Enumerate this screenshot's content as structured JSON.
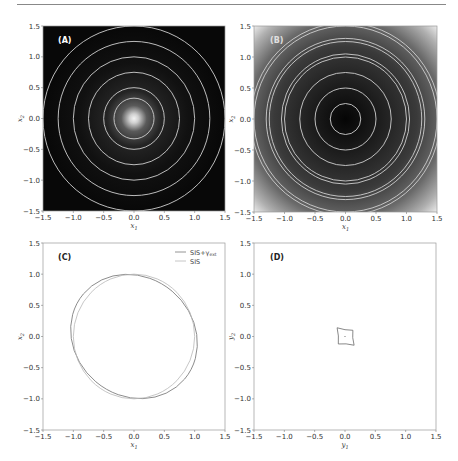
{
  "figure": {
    "panels": [
      "(A)",
      "(B)",
      "(C)",
      "(D)"
    ]
  },
  "chart_data": [
    {
      "type": "heatmap",
      "panel": "(A)",
      "title": "(A)",
      "xlabel": "x1",
      "ylabel": "x2",
      "xlim": [
        -1.5,
        1.5
      ],
      "ylim": [
        -1.5,
        1.5
      ],
      "xticks": [
        "-1.5",
        "-1.0",
        "-0.5",
        "0.0",
        "0.5",
        "1.0",
        "1.5"
      ],
      "yticks": [
        "-1.5",
        "-1.0",
        "-0.5",
        "0.0",
        "0.5",
        "1.0",
        "1.5"
      ],
      "background": "dark, bright central peak at origin",
      "contour_radii": [
        0.33,
        0.5,
        0.75,
        1.0,
        1.25,
        1.5
      ],
      "contour_color": "#cfcfcf"
    },
    {
      "type": "heatmap",
      "panel": "(B)",
      "title": "(B)",
      "xlabel": "x1",
      "ylabel": "x2",
      "xlim": [
        -1.5,
        1.5
      ],
      "ylim": [
        -1.5,
        1.5
      ],
      "xticks": [
        "-1.5",
        "-1.0",
        "-0.5",
        "0.0",
        "0.5",
        "1.0",
        "1.5"
      ],
      "yticks": [
        "-1.5",
        "-1.0",
        "-0.5",
        "0.0",
        "0.5",
        "1.0",
        "1.5"
      ],
      "background": "dark center brightening toward corners",
      "contour_radii": [
        0.25,
        0.5,
        0.75,
        1.0,
        1.05,
        1.25,
        1.3,
        1.5,
        1.55
      ],
      "contour_color": "#cfcfcf"
    },
    {
      "type": "line",
      "panel": "(C)",
      "title": "(C)",
      "xlabel": "x1",
      "ylabel": "x2",
      "xlim": [
        -1.5,
        1.5
      ],
      "ylim": [
        -1.5,
        1.5
      ],
      "xticks": [
        "-1.5",
        "-1.0",
        "-0.5",
        "0.0",
        "0.5",
        "1.0",
        "1.5"
      ],
      "yticks": [
        "-1.5",
        "-1.0",
        "-0.5",
        "0.0",
        "0.5",
        "1.0",
        "1.5"
      ],
      "legend_position": "upper right",
      "series": [
        {
          "name": "SIS+γext",
          "shape": "ellipse",
          "center": [
            0,
            0
          ],
          "semi_major": 1.09,
          "semi_minor": 0.95,
          "angle_deg": -40,
          "color": "#7a7a7a"
        },
        {
          "name": "SIS",
          "shape": "circle",
          "center": [
            0,
            0
          ],
          "radius": 1.0,
          "color": "#b8b8b8"
        }
      ],
      "legend": [
        "SIS+γext",
        "SIS"
      ]
    },
    {
      "type": "line",
      "panel": "(D)",
      "title": "(D)",
      "xlabel": "y1",
      "ylabel": "y2",
      "xlim": [
        -1.5,
        1.5
      ],
      "ylim": [
        -1.5,
        1.5
      ],
      "xticks": [
        "-1.5",
        "-1.0",
        "-0.5",
        "0.0",
        "0.5",
        "1.0",
        "1.5"
      ],
      "yticks": [
        "-1.5",
        "-1.0",
        "-0.5",
        "0.0",
        "0.5",
        "1.0",
        "1.5"
      ],
      "series": [
        {
          "name": "caustic",
          "shape": "astroid",
          "cusps": [
            [
              -0.13,
              0.14
            ],
            [
              0.13,
              0.1
            ],
            [
              0.15,
              -0.14
            ],
            [
              -0.11,
              -0.12
            ]
          ],
          "color": "#6a6a6a"
        }
      ],
      "center_marker": [
        0.0,
        0.0
      ]
    }
  ],
  "labels": {
    "a": "(A)",
    "b": "(B)",
    "c": "(C)",
    "d": "(D)",
    "x1": "x",
    "x2": "x",
    "y1": "y",
    "y2": "y",
    "sub1": "1",
    "sub2": "2",
    "legend_sis_ext": "SIS+γ",
    "legend_sis_ext_sub": "ext",
    "legend_sis": "SIS"
  }
}
